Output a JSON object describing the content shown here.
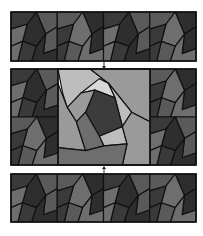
{
  "diagram": {
    "title": "",
    "strips": [
      {
        "id": "top",
        "tile_count": 4,
        "highlight": false
      },
      {
        "id": "middle",
        "tile_count": 3,
        "highlight": true,
        "highlighted_tile": "center"
      },
      {
        "id": "bottom",
        "tile_count": 4,
        "highlight": false
      }
    ],
    "arrows": [
      {
        "from": "top",
        "to": "middle",
        "direction": "down"
      },
      {
        "from": "bottom",
        "to": "middle",
        "direction": "up"
      }
    ],
    "colors": {
      "outline": "#111111",
      "dark": "#3a3a3a",
      "darker": "#2e2e2e",
      "mid": "#5a5a5a",
      "light_mid": "#6e6e6e",
      "highlight_light": "#bdbdbd",
      "highlight_lighter": "#d8d8d8",
      "highlight_mid": "#9a9a9a",
      "highlight_dark": "#3c3c3c",
      "background": "#ffffff"
    }
  }
}
